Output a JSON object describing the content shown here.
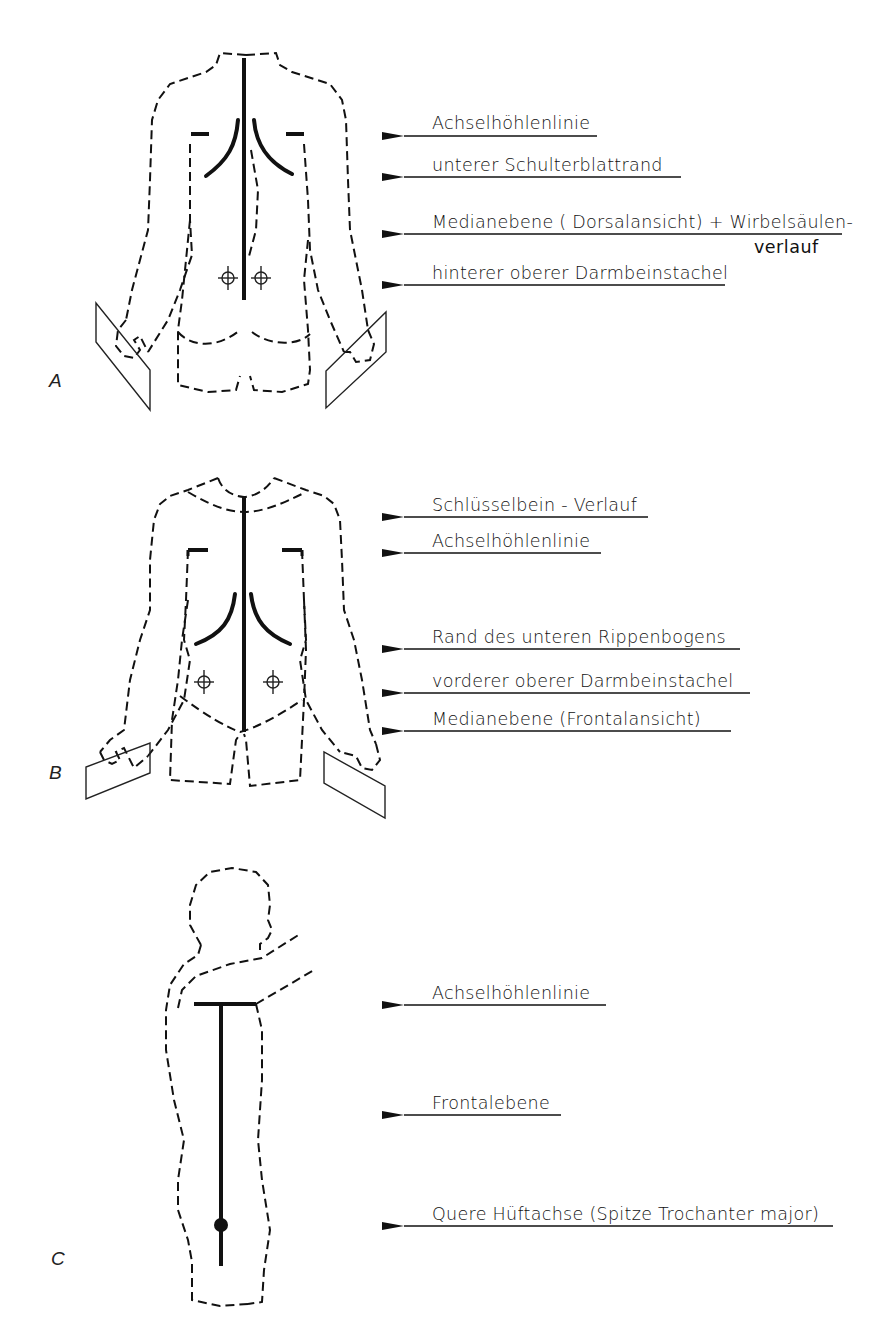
{
  "figure": {
    "type": "anatomical reference-line diagram",
    "panels": [
      {
        "letter": "A",
        "view": "dorsal",
        "labels": [
          {
            "text": "Achselhöhlenlinie"
          },
          {
            "text": "unterer Schulterblattrand"
          },
          {
            "text": "Medianebene ( Dorsalansicht) + Wirbelsäulen-",
            "continuation": "verlauf"
          },
          {
            "text": "hinterer oberer Darmbeinstachel"
          }
        ]
      },
      {
        "letter": "B",
        "view": "frontal",
        "labels": [
          {
            "text": "Schlüsselbein - Verlauf"
          },
          {
            "text": "Achselhöhlenlinie"
          },
          {
            "text": "Rand des unteren Rippenbogens"
          },
          {
            "text": "vorderer oberer Darmbeinstachel"
          },
          {
            "text": "Medianebene (Frontalansicht)"
          }
        ]
      },
      {
        "letter": "C",
        "view": "lateral",
        "labels": [
          {
            "text": "Achselhöhlenlinie"
          },
          {
            "text": "Frontalebene"
          },
          {
            "text": "Quere Hüftachse (Spitze Trochanter major)"
          }
        ]
      }
    ]
  }
}
